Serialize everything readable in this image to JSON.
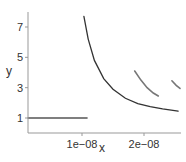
{
  "chart_data": {
    "type": "line",
    "title": "",
    "xlabel": "x",
    "ylabel": "y",
    "xlim": [
      1.3e-09,
      2.6e-08
    ],
    "ylim": [
      0.0,
      8.0
    ],
    "x_ticks": [
      1e-08,
      2e-08
    ],
    "x_tick_labels": [
      "1e−08",
      "2e−08"
    ],
    "y_ticks": [
      1,
      3,
      5,
      7
    ],
    "y_tick_labels": [
      "1",
      "3",
      "5",
      "7"
    ],
    "grid": false,
    "legend": null,
    "series": [
      {
        "name": "flat",
        "color": "#555555",
        "x": [
          1.3e-09,
          1.08e-08
        ],
        "y": [
          1.0,
          1.0
        ]
      },
      {
        "name": "main-curve",
        "color": "#333333",
        "x": [
          1.03e-08,
          1.1e-08,
          1.2e-08,
          1.35e-08,
          1.5e-08,
          1.7e-08,
          1.9e-08,
          2.1e-08,
          2.3e-08,
          2.55e-08
        ],
        "y": [
          7.7,
          6.2,
          4.8,
          3.6,
          2.9,
          2.3,
          1.95,
          1.75,
          1.6,
          1.45
        ]
      },
      {
        "name": "segment-2",
        "color": "#777777",
        "x": [
          1.85e-08,
          1.95e-08,
          2.05e-08,
          2.15e-08,
          2.23e-08
        ],
        "y": [
          4.1,
          3.5,
          3.0,
          2.65,
          2.45
        ]
      },
      {
        "name": "segment-3",
        "color": "#777777",
        "x": [
          2.45e-08,
          2.52e-08,
          2.58e-08
        ],
        "y": [
          3.45,
          3.15,
          2.95
        ]
      }
    ]
  }
}
